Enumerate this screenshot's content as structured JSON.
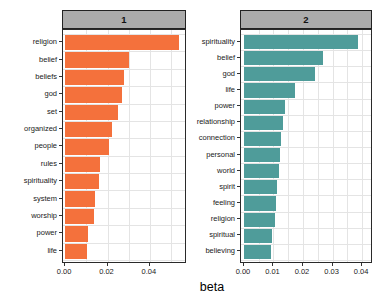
{
  "figure": {
    "xlabel": "beta"
  },
  "colors": {
    "bar_orange": "#F4713C",
    "bar_teal": "#4F9C9A",
    "strip_bg": "#ABABAB",
    "panel_border": "#2A2A2A",
    "grid": "#E4E4E4",
    "tick": "#333333",
    "text": "#1A1A1A"
  },
  "chart_data": [
    {
      "type": "bar",
      "orientation": "horizontal",
      "facet_label": "1",
      "categories": [
        "religion",
        "belief",
        "beliefs",
        "god",
        "set",
        "organized",
        "people",
        "rules",
        "spirituality",
        "system",
        "worship",
        "power",
        "life"
      ],
      "values": [
        0.0535,
        0.03,
        0.028,
        0.0268,
        0.0249,
        0.0221,
        0.0207,
        0.0165,
        0.0158,
        0.0141,
        0.0136,
        0.0108,
        0.0103
      ],
      "xlabel": "beta",
      "ylabel": "",
      "xlim": [
        -0.001,
        0.0575
      ],
      "xticks": [
        0,
        0.02,
        0.04
      ],
      "xtick_labels": [
        "0.00",
        "0.02",
        "0.04"
      ],
      "minor_step": 0.01,
      "bar_color": "#F4713C",
      "grid": true,
      "legend": false
    },
    {
      "type": "bar",
      "orientation": "horizontal",
      "facet_label": "2",
      "categories": [
        "spirituality",
        "belief",
        "god",
        "life",
        "power",
        "relationship",
        "connection",
        "personal",
        "world",
        "spirit",
        "feeling",
        "religion",
        "spiritual",
        "believing"
      ],
      "values": [
        0.0386,
        0.0268,
        0.0242,
        0.0172,
        0.0138,
        0.0133,
        0.0125,
        0.0123,
        0.012,
        0.0113,
        0.0108,
        0.0105,
        0.0094,
        0.0092
      ],
      "xlabel": "beta",
      "ylabel": "",
      "xlim": [
        -0.001,
        0.0437
      ],
      "xticks": [
        0,
        0.01,
        0.02,
        0.03,
        0.04
      ],
      "xtick_labels": [
        "0.00",
        "0.01",
        "0.02",
        "0.03",
        "0.04"
      ],
      "minor_step": 0.005,
      "bar_color": "#4F9C9A",
      "grid": true,
      "legend": false
    }
  ]
}
